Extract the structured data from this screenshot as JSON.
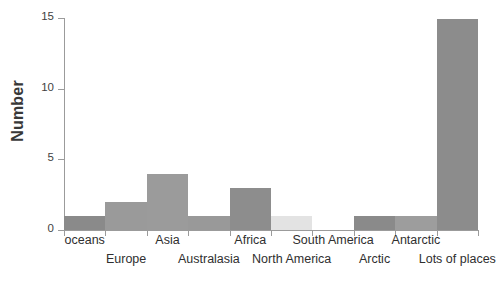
{
  "chart_data": {
    "type": "bar",
    "title": "",
    "subtitle": "",
    "xlabel": "",
    "ylabel": "Number",
    "categories": [
      "oceans",
      "Europe",
      "Asia",
      "Australasia",
      "Africa",
      "North America",
      "South America",
      "Arctic",
      "Antarctic",
      "Lots of places"
    ],
    "values": [
      1,
      2,
      4,
      1,
      3,
      1,
      0,
      1,
      1,
      15
    ],
    "ylim": [
      0,
      15
    ],
    "ytick_labels": [
      "0",
      "5",
      "10",
      "15"
    ],
    "ytick_values": [
      0,
      5,
      10,
      15
    ],
    "grid": false,
    "legend": false,
    "legend_position": "none",
    "bar_colors": [
      "#8a8a8a",
      "#9a9a9a",
      "#9b9b9b",
      "#999999",
      "#8d8d8d",
      "#e3e3e3",
      "#ffffff",
      "#8a8a8a",
      "#9d9d9d",
      "#8c8c8c"
    ],
    "label_rows": [
      "top",
      "bottom",
      "top",
      "bottom",
      "top",
      "bottom",
      "top",
      "bottom",
      "top",
      "bottom"
    ]
  },
  "axis": {
    "y_title": "Number"
  },
  "colors": {
    "axis_line": "#9b9b9b",
    "tick_label": "#3f3f3f",
    "category_label": "#2f2f2f",
    "background": "#ffffff"
  }
}
